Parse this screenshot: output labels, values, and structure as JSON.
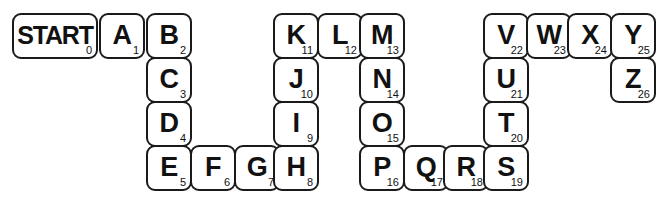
{
  "board": {
    "title": "Alphabet Board Game Path",
    "cell_width": 46,
    "cell_height": 46,
    "border_color": "#1a1a1a",
    "background_color": "#ffffff",
    "cells": [
      {
        "label": "START",
        "number": "0",
        "x": 12,
        "y": 13,
        "w": 86,
        "wide": true
      },
      {
        "label": "A",
        "number": "1",
        "x": 99,
        "y": 13,
        "w": 46,
        "wide": false
      },
      {
        "label": "B",
        "number": "2",
        "x": 146,
        "y": 13,
        "w": 46,
        "wide": false
      },
      {
        "label": "C",
        "number": "3",
        "x": 146,
        "y": 57,
        "w": 46,
        "wide": false
      },
      {
        "label": "D",
        "number": "4",
        "x": 146,
        "y": 101,
        "w": 46,
        "wide": false
      },
      {
        "label": "E",
        "number": "5",
        "x": 146,
        "y": 145,
        "w": 46,
        "wide": false
      },
      {
        "label": "F",
        "number": "6",
        "x": 190,
        "y": 145,
        "w": 46,
        "wide": false
      },
      {
        "label": "G",
        "number": "7",
        "x": 234,
        "y": 145,
        "w": 46,
        "wide": false
      },
      {
        "label": "H",
        "number": "8",
        "x": 273,
        "y": 145,
        "w": 46,
        "wide": false
      },
      {
        "label": "I",
        "number": "9",
        "x": 273,
        "y": 101,
        "w": 46,
        "wide": false
      },
      {
        "label": "J",
        "number": "10",
        "x": 273,
        "y": 57,
        "w": 46,
        "wide": false
      },
      {
        "label": "K",
        "number": "11",
        "x": 273,
        "y": 13,
        "w": 46,
        "wide": false
      },
      {
        "label": "L",
        "number": "12",
        "x": 317,
        "y": 13,
        "w": 46,
        "wide": false
      },
      {
        "label": "M",
        "number": "13",
        "x": 359,
        "y": 13,
        "w": 46,
        "wide": false
      },
      {
        "label": "N",
        "number": "14",
        "x": 359,
        "y": 57,
        "w": 46,
        "wide": false
      },
      {
        "label": "O",
        "number": "15",
        "x": 359,
        "y": 101,
        "w": 46,
        "wide": false
      },
      {
        "label": "P",
        "number": "16",
        "x": 359,
        "y": 145,
        "w": 46,
        "wide": false
      },
      {
        "label": "Q",
        "number": "17",
        "x": 403,
        "y": 145,
        "w": 46,
        "wide": false
      },
      {
        "label": "R",
        "number": "18",
        "x": 443,
        "y": 145,
        "w": 46,
        "wide": false
      },
      {
        "label": "S",
        "number": "19",
        "x": 483,
        "y": 145,
        "w": 46,
        "wide": false
      },
      {
        "label": "T",
        "number": "20",
        "x": 483,
        "y": 101,
        "w": 46,
        "wide": false
      },
      {
        "label": "U",
        "number": "21",
        "x": 483,
        "y": 57,
        "w": 46,
        "wide": false
      },
      {
        "label": "V",
        "number": "22",
        "x": 483,
        "y": 13,
        "w": 46,
        "wide": false
      },
      {
        "label": "W",
        "number": "23",
        "x": 526,
        "y": 13,
        "w": 46,
        "wide": false
      },
      {
        "label": "X",
        "number": "24",
        "x": 567,
        "y": 13,
        "w": 46,
        "wide": false
      },
      {
        "label": "Y",
        "number": "25",
        "x": 610,
        "y": 13,
        "w": 46,
        "wide": false
      },
      {
        "label": "Z",
        "number": "26",
        "x": 610,
        "y": 57,
        "w": 46,
        "wide": false
      }
    ]
  }
}
